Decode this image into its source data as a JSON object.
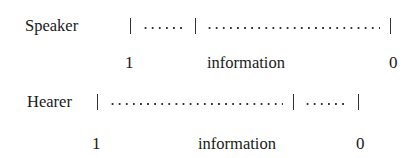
{
  "speaker": {
    "label": "Speaker",
    "segments": [
      "short",
      "long"
    ],
    "scale_start": "1",
    "scale_mid": "information",
    "scale_end": "0"
  },
  "hearer": {
    "label": "Hearer",
    "segments": [
      "long",
      "short"
    ],
    "scale_start": "1",
    "scale_mid": "information",
    "scale_end": "0"
  }
}
